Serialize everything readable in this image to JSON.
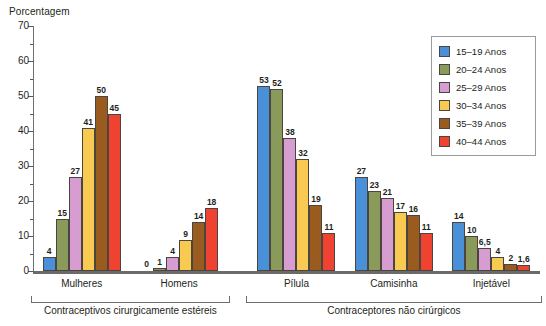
{
  "axis": {
    "ylabel": "Porcentagem",
    "yticks": [
      "0",
      "10",
      "20",
      "30",
      "40",
      "50",
      "60",
      "70"
    ]
  },
  "legend": {
    "items": [
      {
        "label": "15–19 Anos",
        "color": "#4a90d9"
      },
      {
        "label": "20–24 Anos",
        "color": "#8a9a5b"
      },
      {
        "label": "25–29 Anos",
        "color": "#d79cd0"
      },
      {
        "label": "30–34 Anos",
        "color": "#f8ca51"
      },
      {
        "label": "35–39 Anos",
        "color": "#9a5b1f"
      },
      {
        "label": "40–44 Anos",
        "color": "#ef4230"
      }
    ]
  },
  "brackets": [
    {
      "label": "Contraceptivos cirurgicamente estéreis"
    },
    {
      "label": "Contraceptores não cirúrgicos"
    }
  ],
  "groups": [
    {
      "caption": "Mulheres",
      "labels": [
        "4",
        "15",
        "27",
        "41",
        "50",
        "45"
      ]
    },
    {
      "caption": "Homens",
      "labels": [
        "0",
        "1",
        "4",
        "9",
        "14",
        "18"
      ]
    },
    {
      "caption": "Pílula",
      "labels": [
        "53",
        "52",
        "38",
        "32",
        "19",
        "11"
      ]
    },
    {
      "caption": "Camisinha",
      "labels": [
        "27",
        "23",
        "21",
        "17",
        "16",
        "11"
      ]
    },
    {
      "caption": "Injetável",
      "labels": [
        "14",
        "10",
        "6,5",
        "4",
        "2",
        "1,6"
      ]
    }
  ],
  "chart_data": {
    "type": "bar",
    "title": "",
    "xlabel": "",
    "ylabel": "Porcentagem",
    "ylim": [
      0,
      70
    ],
    "ytick_step": 10,
    "yminor_step": 5,
    "grid": false,
    "legend_position": "top-right",
    "categories": [
      "Mulheres",
      "Homens",
      "Pílula",
      "Camisinha",
      "Injetável"
    ],
    "category_groups": [
      {
        "name": "Contraceptivos cirurgicamente estéreis",
        "categories": [
          "Mulheres",
          "Homens"
        ]
      },
      {
        "name": "Contraceptores não cirúrgicos",
        "categories": [
          "Pílula",
          "Camisinha",
          "Injetável"
        ]
      }
    ],
    "series": [
      {
        "name": "15–19 Anos",
        "color": "#4a90d9",
        "values": [
          4,
          0,
          53,
          27,
          14
        ]
      },
      {
        "name": "20–24 Anos",
        "color": "#8a9a5b",
        "values": [
          15,
          1,
          52,
          23,
          10
        ]
      },
      {
        "name": "25–29 Anos",
        "color": "#d79cd0",
        "values": [
          27,
          4,
          38,
          21,
          6.5
        ]
      },
      {
        "name": "30–34 Anos",
        "color": "#f8ca51",
        "values": [
          41,
          9,
          32,
          17,
          4
        ]
      },
      {
        "name": "35–39 Anos",
        "color": "#9a5b1f",
        "values": [
          50,
          14,
          19,
          16,
          2
        ]
      },
      {
        "name": "40–44 Anos",
        "color": "#ef4230",
        "values": [
          45,
          18,
          11,
          11,
          1.6
        ]
      }
    ]
  }
}
